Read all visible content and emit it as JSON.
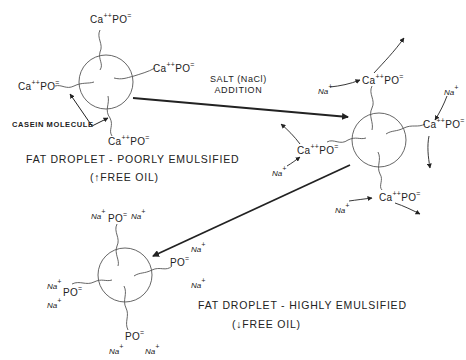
{
  "diagram": {
    "labels": {
      "casein_molecule": "CASEIN MOLECULE",
      "salt_addition_line1": "SALT (NaCl)",
      "salt_addition_line2": "ADDITION",
      "poorly_caption": "FAT DROPLET - POORLY EMULSIFIED",
      "poorly_sub": "(↑FREE OIL)",
      "highly_caption": "FAT DROPLET - HIGHLY EMULSIFIED",
      "highly_sub": "(↓FREE OIL)"
    },
    "ions": {
      "ca": "Ca",
      "ca_charge": "++",
      "po": "PO",
      "po_charge": "=",
      "na": "Na",
      "na_charge": "+"
    },
    "nodes": [
      {
        "id": "poorly-emulsified-droplet",
        "label": "Fat droplet with Ca++ PO= ends on casein molecules",
        "x": 80,
        "y": 84
      },
      {
        "id": "intermediate-droplet",
        "label": "Fat droplet with Na+ displacing Ca++",
        "x": 379,
        "y": 140
      },
      {
        "id": "highly-emulsified-droplet",
        "label": "Fat droplet with Na+ PO= ends",
        "x": 125,
        "y": 266
      }
    ],
    "edges": [
      {
        "from": "poorly-emulsified-droplet",
        "to": "intermediate-droplet",
        "label": "SALT (NaCl) ADDITION"
      },
      {
        "from": "intermediate-droplet",
        "to": "highly-emulsified-droplet",
        "label": ""
      }
    ]
  }
}
